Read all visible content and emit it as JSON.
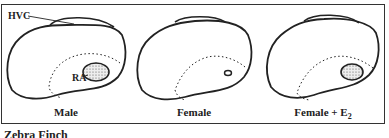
{
  "figure": {
    "title": "Zebra Finch",
    "panels": [
      {
        "label": "Male",
        "annotations": {
          "hvc": "HVC",
          "ra": "RA"
        }
      },
      {
        "label": "Female"
      },
      {
        "label": "Female + E",
        "label_subscript": "2"
      }
    ]
  }
}
